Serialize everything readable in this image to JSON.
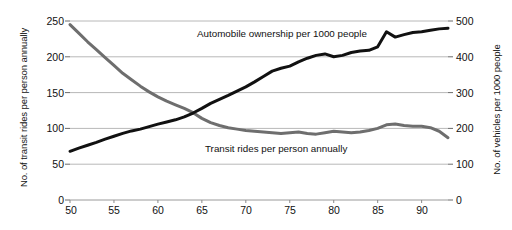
{
  "chart_data": {
    "type": "line",
    "title": "",
    "xlabel": "",
    "ylabel": "No. of transit rides per person annually",
    "y2label": "No. of vehicles per 1000 people",
    "xlim": [
      50,
      93
    ],
    "ylim": [
      0,
      250
    ],
    "y2lim": [
      0,
      500
    ],
    "grid": true,
    "legend_position": "inline-annotations",
    "x_ticks": [
      50,
      55,
      60,
      65,
      70,
      75,
      80,
      85,
      90
    ],
    "x_tick_labels": [
      "50",
      "55",
      "60",
      "65",
      "70",
      "75",
      "80",
      "85",
      "90"
    ],
    "y_ticks": [
      0,
      50,
      100,
      150,
      200,
      250
    ],
    "y_tick_labels": [
      "0",
      "50",
      "100",
      "150",
      "200",
      "250"
    ],
    "y2_ticks": [
      0,
      100,
      200,
      300,
      400,
      500
    ],
    "y2_tick_labels": [
      "0",
      "100",
      "200",
      "300",
      "400",
      "500"
    ],
    "x": [
      50,
      51,
      52,
      53,
      54,
      55,
      56,
      57,
      58,
      59,
      60,
      61,
      62,
      63,
      64,
      65,
      66,
      67,
      68,
      69,
      70,
      71,
      72,
      73,
      74,
      75,
      76,
      77,
      78,
      79,
      80,
      81,
      82,
      83,
      84,
      85,
      86,
      87,
      88,
      89,
      90,
      91,
      92,
      93
    ],
    "series": [
      {
        "name": "Transit rides per person annually",
        "axis": "left",
        "color": "#6e6e6e",
        "label_text": "Transit rides per person annually",
        "values": [
          245,
          233,
          221,
          210,
          199,
          188,
          177,
          168,
          159,
          151,
          144,
          138,
          133,
          128,
          122,
          114,
          108,
          104,
          101,
          99,
          97,
          96,
          95,
          94,
          93,
          94,
          95,
          93,
          92,
          94,
          96,
          95,
          94,
          95,
          97,
          100,
          105,
          106,
          104,
          103,
          103,
          101,
          96,
          87
        ]
      },
      {
        "name": "Automobile ownership per 1000 people",
        "axis": "right",
        "color": "#111111",
        "label_text": "Automobile ownership per 1000 people",
        "values": [
          136,
          145,
          153,
          161,
          170,
          178,
          186,
          193,
          198,
          205,
          212,
          218,
          224,
          232,
          243,
          256,
          270,
          281,
          292,
          304,
          316,
          330,
          345,
          360,
          368,
          374,
          386,
          396,
          404,
          408,
          400,
          404,
          412,
          416,
          418,
          428,
          470,
          455,
          462,
          468,
          470,
          474,
          478,
          480
        ]
      }
    ]
  },
  "axes": {
    "left_title": "No. of transit rides per person annually",
    "right_title": "No. of vehicles per 1000 people"
  }
}
